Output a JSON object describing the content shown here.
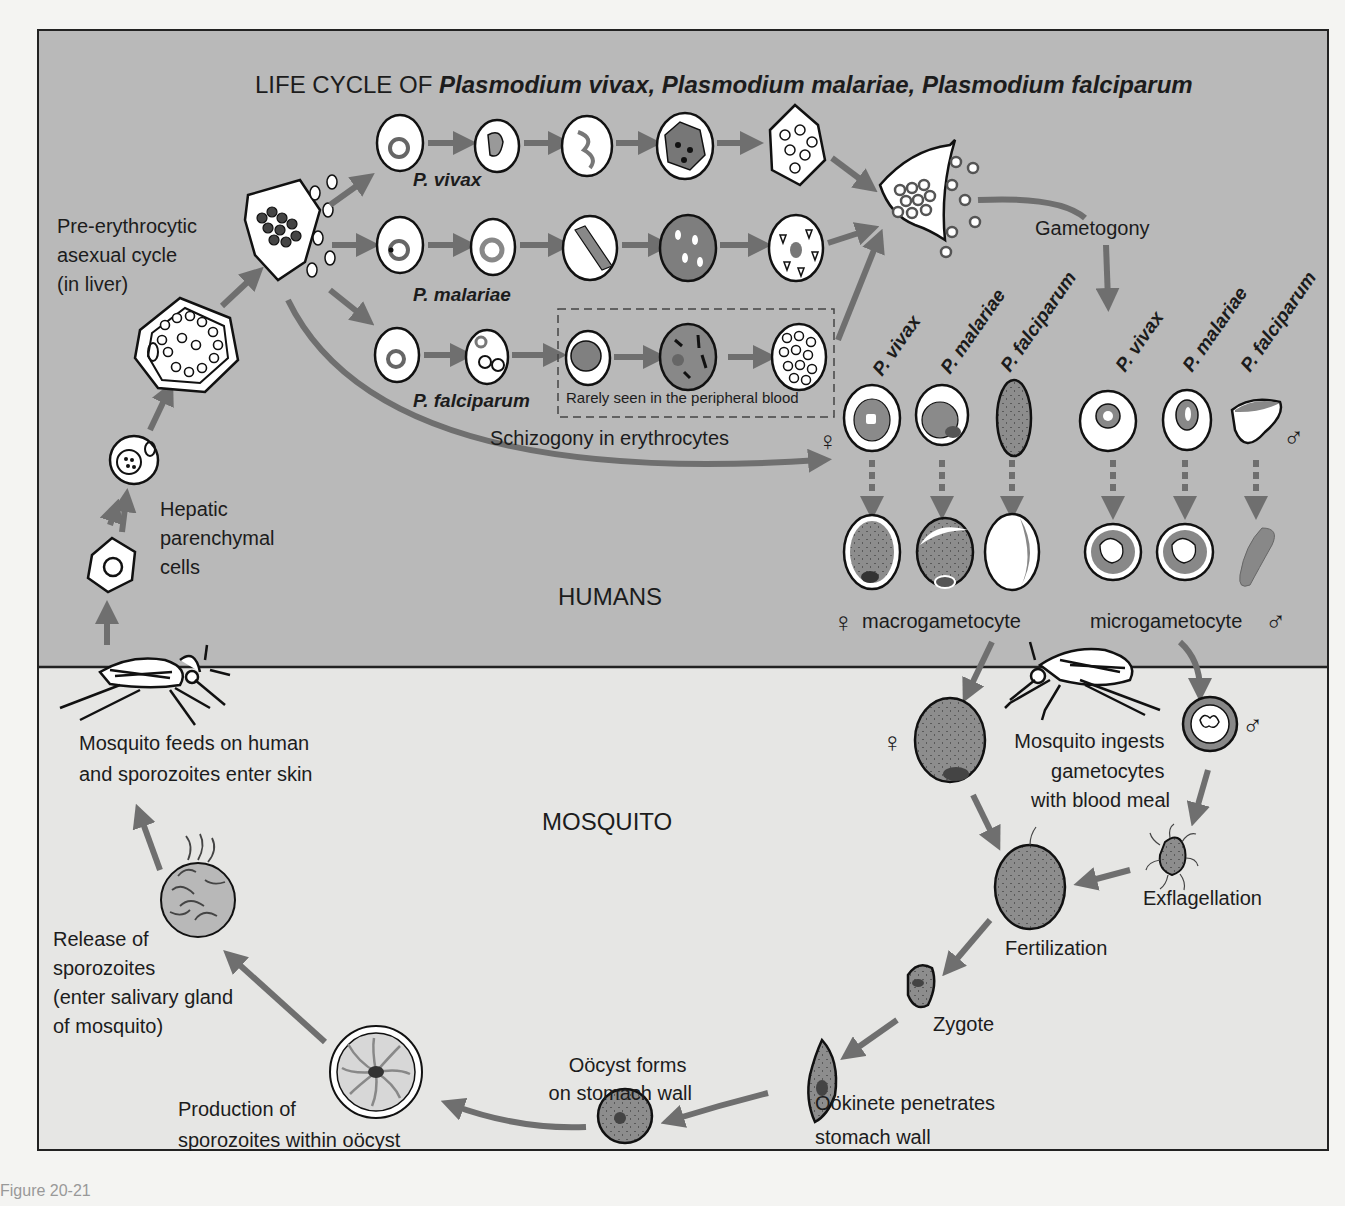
{
  "figure": {
    "title_prefix": "LIFE CYCLE OF ",
    "title_species": "Plasmodium vivax, Plasmodium malariae, Plasmodium falciparum",
    "figure_caption_partial": "Figure 20-21",
    "colors": {
      "humans_bg": "#b9b9b9",
      "mosquito_bg": "#e6e6e4",
      "arrow": "#6f6f6f",
      "cell_fill": "#ffffff",
      "parasite_fill": "#8a8a8a",
      "outline": "#111111"
    }
  },
  "zones": {
    "humans": "HUMANS",
    "mosquito": "MOSQUITO"
  },
  "liver": {
    "pre_erythrocytic_line1": "Pre-erythrocytic",
    "pre_erythrocytic_line2": "asexual cycle",
    "pre_erythrocytic_line3": "(in liver)",
    "hepatic_line1": "Hepatic",
    "hepatic_line2": "parenchymal",
    "hepatic_line3": "cells"
  },
  "schizogony": {
    "species": [
      {
        "label": "P. vivax",
        "stages": 5
      },
      {
        "label": "P. malariae",
        "stages": 5
      },
      {
        "label": "P. falciparum",
        "stages": 5
      }
    ],
    "rarely_seen": "Rarely seen in the peripheral blood",
    "caption": "Schizogony in erythrocytes"
  },
  "gametogony": {
    "label": "Gametogony",
    "female_species": [
      "P. vivax",
      "P. malariae",
      "P. falciparum"
    ],
    "male_species": [
      "P. vivax",
      "P. malariae",
      "P. falciparum"
    ],
    "female_symbol": "♀",
    "male_symbol": "♂",
    "macrogametocyte": "macrogametocyte",
    "microgametocyte": "microgametocyte"
  },
  "mosquito_cycle": {
    "ingests_line1": "Mosquito ingests",
    "ingests_line2": "gametocytes",
    "ingests_line3": "with blood meal",
    "exflagellation": "Exflagellation",
    "fertilization": "Fertilization",
    "zygote": "Zygote",
    "ookinete_line1": "Oökinete penetrates",
    "ookinete_line2": "stomach wall",
    "oocyst_line1": "Oöcyst forms",
    "oocyst_line2": "on stomach wall",
    "production_line1": "Production of",
    "production_line2": "sporozoites within oöcyst",
    "release_line1": "Release of",
    "release_line2": "sporozoites",
    "release_line3": "(enter salivary gland",
    "release_line4": "of mosquito)",
    "feeds_line1": "Mosquito feeds on human",
    "feeds_line2": "and sporozoites enter skin"
  }
}
